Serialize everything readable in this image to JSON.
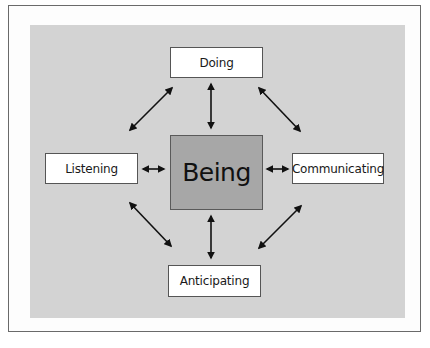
{
  "diagram": {
    "type": "hub-and-spoke",
    "center": {
      "label": "Being",
      "fill": "#a7a7a7"
    },
    "nodes": {
      "top": {
        "label": "Doing"
      },
      "left": {
        "label": "Listening"
      },
      "right": {
        "label": "Communicating"
      },
      "bottom": {
        "label": "Anticipating"
      }
    },
    "connections": [
      {
        "from": "Being",
        "to": "Doing",
        "style": "double-arrow"
      },
      {
        "from": "Being",
        "to": "Listening",
        "style": "double-arrow"
      },
      {
        "from": "Being",
        "to": "Communicating",
        "style": "double-arrow"
      },
      {
        "from": "Being",
        "to": "Anticipating",
        "style": "double-arrow"
      },
      {
        "from": "Doing",
        "to": "Listening",
        "style": "double-arrow"
      },
      {
        "from": "Doing",
        "to": "Communicating",
        "style": "double-arrow"
      },
      {
        "from": "Anticipating",
        "to": "Listening",
        "style": "double-arrow"
      },
      {
        "from": "Anticipating",
        "to": "Communicating",
        "style": "double-arrow"
      }
    ],
    "colors": {
      "panel": "#d3d3d3",
      "node_fill": "#ffffff",
      "arrow": "#111111",
      "frame_border": "#6a6a6a"
    }
  }
}
